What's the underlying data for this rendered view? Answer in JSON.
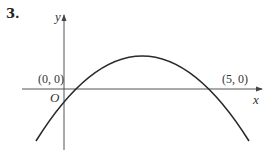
{
  "question_number": "3.",
  "axes": {
    "x_label": "x",
    "y_label": "y",
    "origin_label": "O"
  },
  "points": [
    {
      "label": "(0, 0)"
    },
    {
      "label": "(5, 0)"
    }
  ],
  "curve": {
    "type": "downward parabola",
    "roots": [
      0,
      5
    ]
  },
  "colors": {
    "stroke": "#2a2a2a",
    "axis": "#555555"
  }
}
